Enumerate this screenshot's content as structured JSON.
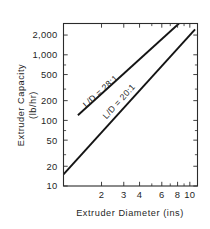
{
  "chart_data": {
    "type": "line",
    "title": "",
    "xlabel": "Extruder Diameter (ins)",
    "ylabel": "Extruder Capacity (lb/hr)",
    "ylabel_line1": "Extruder Capacity",
    "ylabel_line2": "(lb/hr)",
    "xscale": "log",
    "yscale": "log",
    "xlim": [
      1.0,
      11.5
    ],
    "ylim": [
      10,
      3000
    ],
    "grid": false,
    "legend_position": "inline-on-lines",
    "xticks": [
      {
        "value": 2,
        "label": "2",
        "minor": false
      },
      {
        "value": 3,
        "label": "3",
        "minor": false
      },
      {
        "value": 4,
        "label": "4",
        "minor": false
      },
      {
        "value": 5,
        "label": "",
        "minor": true
      },
      {
        "value": 6,
        "label": "6",
        "minor": false
      },
      {
        "value": 7,
        "label": "",
        "minor": true
      },
      {
        "value": 8,
        "label": "8",
        "minor": false
      },
      {
        "value": 9,
        "label": "",
        "minor": true
      },
      {
        "value": 10,
        "label": "10",
        "minor": false
      }
    ],
    "yticks": [
      {
        "value": 10,
        "label": "10",
        "minor": false
      },
      {
        "value": 20,
        "label": "20",
        "minor": false
      },
      {
        "value": 30,
        "label": "",
        "minor": true
      },
      {
        "value": 50,
        "label": "50",
        "minor": false
      },
      {
        "value": 70,
        "label": "",
        "minor": true
      },
      {
        "value": 100,
        "label": "100",
        "minor": false
      },
      {
        "value": 200,
        "label": "200",
        "minor": false
      },
      {
        "value": 300,
        "label": "",
        "minor": true
      },
      {
        "value": 500,
        "label": "500",
        "minor": false
      },
      {
        "value": 700,
        "label": "",
        "minor": true
      },
      {
        "value": 1000,
        "label": "1,000",
        "minor": false
      },
      {
        "value": 2000,
        "label": "2,000",
        "minor": false
      }
    ],
    "series": [
      {
        "name": "L/D = 28:1",
        "label": "L/D = 28:1",
        "color": "#141414",
        "points": [
          {
            "x": 1.3,
            "y": 120
          },
          {
            "x": 8.2,
            "y": 3000
          }
        ]
      },
      {
        "name": "L/D = 20:1",
        "label": "L/D = 20:1",
        "color": "#141414",
        "points": [
          {
            "x": 1.0,
            "y": 15
          },
          {
            "x": 11.0,
            "y": 2450
          }
        ]
      }
    ]
  },
  "colors": {
    "ink": "#1f1f1f",
    "line": "#141414",
    "background": "#ffffff"
  }
}
